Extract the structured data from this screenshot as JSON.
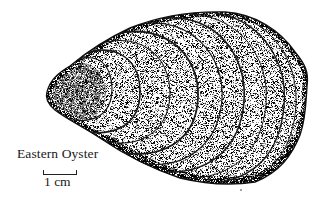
{
  "figure": {
    "caption": "Eastern Oyster",
    "scale_bar": {
      "label": "1 cm"
    },
    "colors": {
      "ink": "#1a1a1a",
      "background": "#ffffff"
    }
  }
}
